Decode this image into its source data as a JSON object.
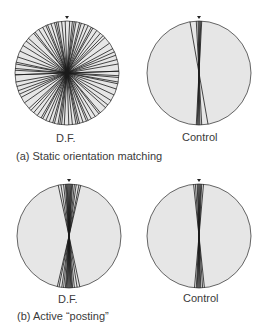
{
  "colors": {
    "disc_fill": "#e6e6e6",
    "disc_stroke": "#555555",
    "line": "#1a1a1a"
  },
  "panels": [
    {
      "caption": "(a) Static orientation matching",
      "plots": [
        {
          "label": "D.F.",
          "cx": 67,
          "cy": 73,
          "r": 52,
          "angles": [
            -2,
            3,
            6,
            -6,
            -10,
            10,
            14,
            -14,
            -18,
            20,
            24,
            -24,
            -28,
            30,
            35,
            -33,
            40,
            -40,
            47,
            -48,
            55,
            -58,
            62,
            70,
            -65,
            80,
            88,
            -85,
            -78,
            93,
            -92,
            100,
            -72,
            75,
            66,
            -52,
            44,
            -38,
            28,
            -22,
            16,
            -12,
            8
          ]
        },
        {
          "label": "Control",
          "cx": 199,
          "cy": 73,
          "r": 52,
          "angles": [
            -1,
            0,
            1,
            2,
            -10,
            -3,
            3
          ]
        }
      ]
    },
    {
      "caption": "(b) Active “posting”",
      "plots": [
        {
          "label": "D.F.",
          "cx": 69,
          "cy": 236,
          "r": 52,
          "angles": [
            -12,
            -9,
            -6,
            -4,
            -3,
            -2,
            -1,
            0,
            1,
            2,
            3,
            4,
            6,
            8,
            11,
            13
          ]
        },
        {
          "label": "Control",
          "cx": 199,
          "cy": 236,
          "r": 52,
          "angles": [
            -6,
            -4,
            -2,
            -1,
            0,
            1,
            2,
            3,
            5
          ]
        }
      ]
    }
  ]
}
